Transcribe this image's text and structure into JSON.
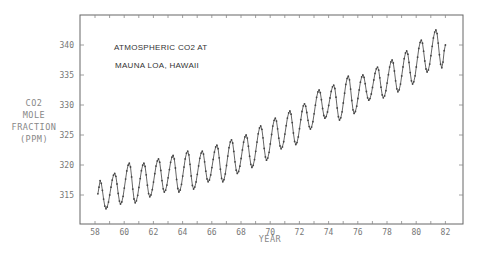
{
  "chart_data": {
    "type": "line",
    "title": [
      "ATMOSPHERIC CO2 AT",
      "MAUNA LOA, HAWAII"
    ],
    "xlabel": "YEAR",
    "ylabel": [
      "CO2",
      "MOLE",
      "FRACTION",
      "(PPM)"
    ],
    "xlim": [
      57.5,
      83.1
    ],
    "ylim": [
      310,
      345
    ],
    "x_ticks": [
      58,
      60,
      62,
      64,
      66,
      68,
      70,
      72,
      74,
      76,
      78,
      80,
      82
    ],
    "y_ticks": [
      315,
      320,
      325,
      330,
      335,
      340
    ],
    "grid": false,
    "legend": null,
    "series": [
      {
        "name": "CO2 mole fraction (ppm)",
        "seasonal_extrema": [
          {
            "x": 58.2,
            "y": 315.2
          },
          {
            "x": 58.35,
            "y": 317.4
          },
          {
            "x": 58.75,
            "y": 312.7
          },
          {
            "x": 59.35,
            "y": 318.6
          },
          {
            "x": 59.75,
            "y": 313.5
          },
          {
            "x": 60.35,
            "y": 320.3
          },
          {
            "x": 60.75,
            "y": 313.7
          },
          {
            "x": 61.35,
            "y": 320.3
          },
          {
            "x": 61.75,
            "y": 314.7
          },
          {
            "x": 62.35,
            "y": 321.0
          },
          {
            "x": 62.75,
            "y": 315.5
          },
          {
            "x": 63.35,
            "y": 321.6
          },
          {
            "x": 63.75,
            "y": 315.5
          },
          {
            "x": 64.35,
            "y": 322.3
          },
          {
            "x": 64.75,
            "y": 316.0
          },
          {
            "x": 65.35,
            "y": 322.3
          },
          {
            "x": 65.75,
            "y": 317.2
          },
          {
            "x": 66.35,
            "y": 323.3
          },
          {
            "x": 66.75,
            "y": 317.2
          },
          {
            "x": 67.35,
            "y": 324.2
          },
          {
            "x": 67.75,
            "y": 318.6
          },
          {
            "x": 68.35,
            "y": 325.0
          },
          {
            "x": 68.75,
            "y": 319.6
          },
          {
            "x": 69.35,
            "y": 326.5
          },
          {
            "x": 69.75,
            "y": 320.8
          },
          {
            "x": 70.35,
            "y": 327.8
          },
          {
            "x": 70.75,
            "y": 322.7
          },
          {
            "x": 71.35,
            "y": 329.0
          },
          {
            "x": 71.75,
            "y": 323.4
          },
          {
            "x": 72.35,
            "y": 330.2
          },
          {
            "x": 72.75,
            "y": 326.0
          },
          {
            "x": 73.35,
            "y": 332.5
          },
          {
            "x": 73.75,
            "y": 327.8
          },
          {
            "x": 74.35,
            "y": 333.3
          },
          {
            "x": 74.75,
            "y": 327.5
          },
          {
            "x": 75.35,
            "y": 334.8
          },
          {
            "x": 75.75,
            "y": 328.6
          },
          {
            "x": 76.35,
            "y": 335.0
          },
          {
            "x": 76.75,
            "y": 330.8
          },
          {
            "x": 77.35,
            "y": 336.3
          },
          {
            "x": 77.75,
            "y": 331.2
          },
          {
            "x": 78.35,
            "y": 337.5
          },
          {
            "x": 78.75,
            "y": 332.2
          },
          {
            "x": 79.35,
            "y": 339.0
          },
          {
            "x": 79.75,
            "y": 333.5
          },
          {
            "x": 80.35,
            "y": 340.8
          },
          {
            "x": 80.75,
            "y": 335.5
          },
          {
            "x": 81.35,
            "y": 342.5
          },
          {
            "x": 81.75,
            "y": 336.2
          },
          {
            "x": 82.0,
            "y": 340.0
          }
        ]
      }
    ]
  },
  "layout_hint": {
    "plot_px": {
      "left": 80,
      "top": 15,
      "right": 463,
      "bottom": 224
    },
    "x_px_per_year": 14.6,
    "x_px_at_58": 95,
    "y_px_at_340": 45,
    "y_px_per_ppm": 6
  }
}
